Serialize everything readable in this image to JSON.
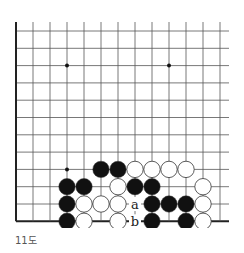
{
  "diagram": {
    "caption": "11도",
    "board": {
      "cols": 13,
      "rows": 12,
      "origin_x": 16,
      "origin_y": 31,
      "spacing_x": 17.0,
      "spacing_y": 17.3,
      "top_extend": 9,
      "right_extend": 9,
      "left_edge": true,
      "bottom_edge": true,
      "star_points": [
        [
          3,
          2
        ],
        [
          9,
          2
        ],
        [
          3,
          8
        ]
      ],
      "stones": [
        {
          "col": 5,
          "row": 8,
          "color": "black"
        },
        {
          "col": 6,
          "row": 8,
          "color": "black"
        },
        {
          "col": 7,
          "row": 8,
          "color": "white"
        },
        {
          "col": 8,
          "row": 8,
          "color": "white"
        },
        {
          "col": 9,
          "row": 8,
          "color": "white"
        },
        {
          "col": 10,
          "row": 8,
          "color": "white"
        },
        {
          "col": 3,
          "row": 9,
          "color": "black"
        },
        {
          "col": 4,
          "row": 9,
          "color": "black"
        },
        {
          "col": 6,
          "row": 9,
          "color": "white"
        },
        {
          "col": 7,
          "row": 9,
          "color": "black"
        },
        {
          "col": 8,
          "row": 9,
          "color": "black"
        },
        {
          "col": 11,
          "row": 9,
          "color": "white"
        },
        {
          "col": 3,
          "row": 10,
          "color": "black"
        },
        {
          "col": 4,
          "row": 10,
          "color": "white"
        },
        {
          "col": 5,
          "row": 10,
          "color": "white"
        },
        {
          "col": 6,
          "row": 10,
          "color": "white"
        },
        {
          "col": 8,
          "row": 10,
          "color": "black"
        },
        {
          "col": 9,
          "row": 10,
          "color": "black"
        },
        {
          "col": 10,
          "row": 10,
          "color": "black"
        },
        {
          "col": 11,
          "row": 10,
          "color": "white"
        },
        {
          "col": 3,
          "row": 11,
          "color": "black"
        },
        {
          "col": 4,
          "row": 11,
          "color": "white"
        },
        {
          "col": 6,
          "row": 11,
          "color": "white"
        },
        {
          "col": 8,
          "row": 11,
          "color": "black"
        },
        {
          "col": 10,
          "row": 11,
          "color": "black"
        },
        {
          "col": 11,
          "row": 11,
          "color": "white"
        }
      ],
      "labels": [
        {
          "col": 7,
          "row": 10,
          "text": "a"
        },
        {
          "col": 7,
          "row": 11,
          "text": "b"
        }
      ]
    },
    "colors": {
      "line": "#555555",
      "edge": "#222222",
      "black_stone": "#111111",
      "white_stone": "#ffffff",
      "stone_outline": "#333333"
    }
  }
}
